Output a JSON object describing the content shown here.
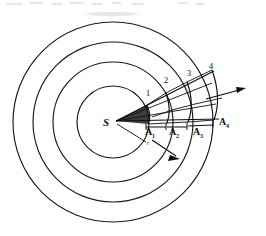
{
  "figure": {
    "source_label": "S",
    "radius_label": "r",
    "background_color": "#ffffff",
    "ink_color": "#111111"
  },
  "wavefronts": {
    "count": 4,
    "center": {
      "x": 113,
      "y": 122
    },
    "radii": [
      36,
      60,
      80,
      100
    ],
    "stroke_color": "#1a1a1a"
  },
  "ray_numbers": [
    {
      "label": "1",
      "x": 148,
      "y": 96
    },
    {
      "label": "2",
      "x": 166,
      "y": 83
    },
    {
      "label": "3",
      "x": 189,
      "y": 76
    },
    {
      "label": "4",
      "x": 211,
      "y": 69
    }
  ],
  "area_labels": [
    {
      "base": "A",
      "sub": "1",
      "x": 148,
      "y": 133
    },
    {
      "base": "A",
      "sub": "2",
      "x": 172,
      "y": 133
    },
    {
      "base": "A",
      "sub": "3",
      "x": 196,
      "y": 133
    },
    {
      "base": "A",
      "sub": "4",
      "x": 222,
      "y": 124
    }
  ],
  "arrows": {
    "propagation_arrow": {
      "from_x": 206,
      "from_y": 99,
      "to_x": 246,
      "to_y": 88
    },
    "wavefront_arrow": {
      "from_x": 152,
      "from_y": 140,
      "to_x": 179,
      "to_y": 158
    }
  }
}
